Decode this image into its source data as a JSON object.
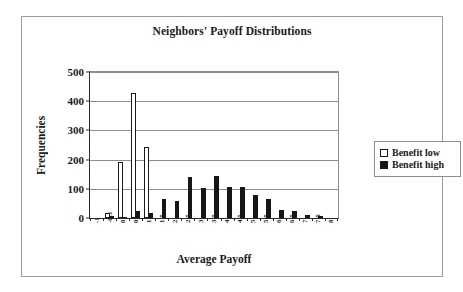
{
  "figure": {
    "title": "Neighbors' Payoff Distributions",
    "xlabel": "Average Payoff",
    "ylabel": "Frequencies"
  },
  "legend": {
    "items": [
      {
        "label": "Benefit low",
        "swatch": "white-square-icon",
        "color": "#ffffff"
      },
      {
        "label": "Benefit high",
        "swatch": "black-square-icon",
        "color": "#161616"
      }
    ]
  },
  "chart_data": {
    "type": "bar",
    "title": "Neighbors' Payoff Distributions",
    "xlabel": "Average Payoff",
    "ylabel": "Frequencies",
    "categories": [
      "-1",
      "-0.5",
      "0",
      "0.5",
      "1",
      "1.5",
      "2",
      "2.5",
      "3",
      "3.5",
      "4",
      "4.5",
      "5",
      "5.5",
      "6",
      "6.5",
      "7",
      "7.5",
      "8"
    ],
    "series": [
      {
        "name": "Benefit low",
        "color": "#ffffff",
        "values": [
          0,
          18,
          192,
          427,
          242,
          0,
          0,
          0,
          0,
          0,
          0,
          0,
          0,
          0,
          0,
          0,
          0,
          0,
          0
        ]
      },
      {
        "name": "Benefit high",
        "color": "#161616",
        "values": [
          0,
          8,
          5,
          23,
          18,
          64,
          58,
          139,
          103,
          143,
          105,
          107,
          79,
          66,
          29,
          24,
          12,
          8,
          0
        ]
      }
    ],
    "ylim": [
      0,
      500
    ],
    "yticks": [
      0,
      100,
      200,
      300,
      400,
      500
    ],
    "ytick_labels": [
      "0",
      "100",
      "200",
      "300",
      "400",
      "500"
    ],
    "grid": "horizontal",
    "legend_position": "right-outside"
  }
}
